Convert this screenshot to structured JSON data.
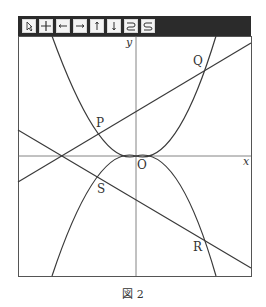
{
  "toolbar": {
    "buttons": [
      {
        "name": "pointer-icon",
        "glyph": "pointer"
      },
      {
        "name": "grid-icon",
        "glyph": "cross"
      },
      {
        "name": "arrow-left-icon",
        "glyph": "left"
      },
      {
        "name": "arrow-right-icon",
        "glyph": "right"
      },
      {
        "name": "arrow-up-icon",
        "glyph": "up"
      },
      {
        "name": "arrow-down-icon",
        "glyph": "down"
      },
      {
        "name": "undo-icon",
        "glyph": "undo"
      },
      {
        "name": "redo-icon",
        "glyph": "redo"
      }
    ]
  },
  "graph": {
    "axis_x_label": "x",
    "axis_y_label": "y",
    "origin_label": "O",
    "points": {
      "P": "P",
      "Q": "Q",
      "R": "R",
      "S": "S"
    },
    "colors": {
      "curve": "#3a3a3a",
      "axis": "#555555",
      "frame": "#555555"
    }
  },
  "caption": "図 2"
}
